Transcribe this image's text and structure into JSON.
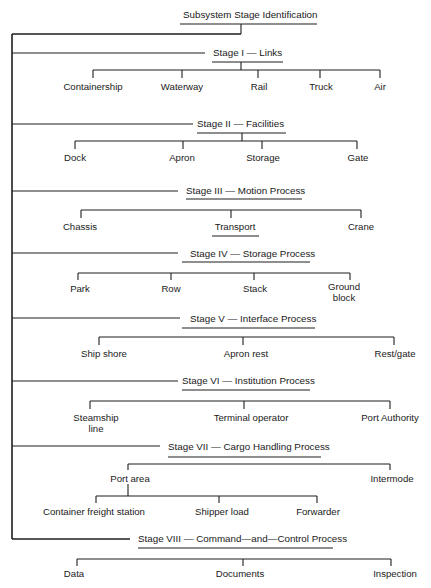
{
  "title": "Subsystem Stage Identification",
  "stages": [
    {
      "label": "Stage I — Links",
      "children": [
        "Containership",
        "Waterway",
        "Rail",
        "Truck",
        "Air"
      ]
    },
    {
      "label": "Stage II — Facilities",
      "children": [
        "Dock",
        "Apron",
        "Storage",
        "Gate"
      ]
    },
    {
      "label": "Stage III — Motion Process",
      "children": [
        "Chassis",
        "Transport",
        "Crane"
      ]
    },
    {
      "label": "Stage IV — Storage Process",
      "children": [
        "Park",
        "Row",
        "Stack",
        "Ground",
        "block"
      ]
    },
    {
      "label": "Stage V — Interface Process",
      "children": [
        "Ship shore",
        "Apron rest",
        "Rest/gate"
      ]
    },
    {
      "label": "Stage VI — Institution Process",
      "children": [
        "Steamship",
        "line",
        "Terminal operator",
        "Port Authority"
      ]
    },
    {
      "label": "Stage VII — Cargo Handling Process",
      "children": [
        "Port area",
        "Intermode"
      ],
      "port_area_children": [
        "Container freight station",
        "Shipper load",
        "Forwarder"
      ]
    },
    {
      "label": "Stage VIII — Command—and—Control Process",
      "children": [
        "Data",
        "Documents",
        "Inspection"
      ]
    }
  ]
}
